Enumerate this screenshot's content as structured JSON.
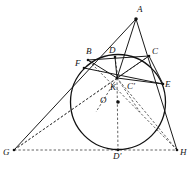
{
  "figure": {
    "canvas": {
      "width": 192,
      "height": 176
    },
    "style": {
      "stroke_color": "#111111",
      "dashed_color": "#3a3a3a",
      "background": "#ffffff",
      "label_color": "#141414"
    },
    "circle": {
      "name": "inscribed-circle",
      "center_label": "O",
      "cx": 118,
      "cy": 102,
      "r": 47.5
    },
    "points": [
      {
        "id": "A",
        "label": "A",
        "x": 136,
        "y": 19,
        "lx": 137,
        "ly": 5,
        "dot": true
      },
      {
        "id": "B",
        "label": "B",
        "x": 88,
        "y": 60,
        "lx": 86,
        "ly": 47,
        "dot": true
      },
      {
        "id": "D",
        "label": "D",
        "x": 115,
        "y": 57,
        "lx": 109,
        "ly": 46,
        "dot": true
      },
      {
        "id": "C",
        "label": "C",
        "x": 149,
        "y": 56,
        "lx": 152,
        "ly": 47,
        "dot": true
      },
      {
        "id": "F",
        "label": "F",
        "x": 84,
        "y": 68,
        "lx": 75,
        "ly": 59,
        "dot": true
      },
      {
        "id": "K",
        "label": "K",
        "x": 117,
        "y": 78,
        "lx": 110,
        "ly": 83,
        "dot": true
      },
      {
        "id": "Cp",
        "label": "C'",
        "x": 131,
        "y": 84,
        "lx": 127,
        "ly": 82,
        "dot": false
      },
      {
        "id": "E",
        "label": "E",
        "x": 163,
        "y": 84,
        "lx": 165,
        "ly": 80,
        "dot": true
      },
      {
        "id": "O",
        "label": "O",
        "x": 118,
        "y": 102,
        "lx": 100,
        "ly": 96,
        "dot": true
      },
      {
        "id": "G",
        "label": "G",
        "x": 14,
        "y": 150,
        "lx": 3,
        "ly": 148,
        "dot": true
      },
      {
        "id": "Dp",
        "label": "D'",
        "x": 118,
        "y": 150,
        "lx": 113,
        "ly": 152,
        "dot": true
      },
      {
        "id": "H",
        "label": "H",
        "x": 177,
        "y": 150,
        "lx": 180,
        "ly": 148,
        "dot": true
      }
    ],
    "solid_segments": [
      {
        "name": "segment-A-G",
        "x1": 136,
        "y1": 19,
        "x2": 14,
        "y2": 150
      },
      {
        "name": "segment-A-H",
        "x1": 136,
        "y1": 19,
        "x2": 177,
        "y2": 150
      },
      {
        "name": "segment-A-K",
        "x1": 136,
        "y1": 19,
        "x2": 117,
        "y2": 78
      },
      {
        "name": "segment-B-C",
        "x1": 88,
        "y1": 60,
        "x2": 149,
        "y2": 56
      },
      {
        "name": "segment-F-E",
        "x1": 84,
        "y1": 68,
        "x2": 163,
        "y2": 84
      },
      {
        "name": "segment-B-K",
        "x1": 88,
        "y1": 60,
        "x2": 117,
        "y2": 78
      },
      {
        "name": "segment-C-K",
        "x1": 149,
        "y1": 56,
        "x2": 117,
        "y2": 78
      },
      {
        "name": "segment-D-K",
        "x1": 115,
        "y1": 57,
        "x2": 117,
        "y2": 78
      },
      {
        "name": "segment-K-E",
        "x1": 117,
        "y1": 78,
        "x2": 163,
        "y2": 84
      },
      {
        "name": "segment-C-E",
        "x1": 149,
        "y1": 56,
        "x2": 163,
        "y2": 84
      }
    ],
    "dashed_segments": [
      {
        "name": "segment-G-H",
        "x1": 14,
        "y1": 150,
        "x2": 177,
        "y2": 150
      },
      {
        "name": "segment-G-K",
        "x1": 14,
        "y1": 150,
        "x2": 117,
        "y2": 78
      },
      {
        "name": "segment-G-C",
        "x1": 14,
        "y1": 150,
        "x2": 149,
        "y2": 56
      },
      {
        "name": "segment-H-K",
        "x1": 177,
        "y1": 150,
        "x2": 117,
        "y2": 78
      },
      {
        "name": "segment-H-B",
        "x1": 177,
        "y1": 150,
        "x2": 88,
        "y2": 60
      },
      {
        "name": "segment-K-Dp",
        "x1": 117,
        "y1": 78,
        "x2": 118,
        "y2": 150
      },
      {
        "name": "segment-D-Dp",
        "x1": 115,
        "y1": 57,
        "x2": 118,
        "y2": 78
      },
      {
        "name": "segment-K-F2",
        "x1": 117,
        "y1": 78,
        "x2": 96,
        "y2": 112
      },
      {
        "name": "segment-K-E2",
        "x1": 117,
        "y1": 78,
        "x2": 140,
        "y2": 112
      }
    ]
  }
}
